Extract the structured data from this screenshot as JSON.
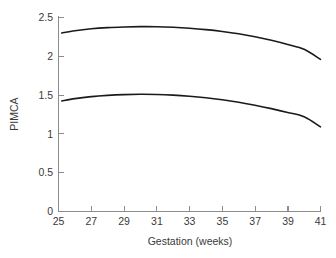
{
  "chart_data": {
    "type": "line",
    "title": "",
    "xlabel": "Gestation (weeks)",
    "ylabel": "PIMCA",
    "xlim": [
      25,
      41
    ],
    "ylim": [
      0,
      2.5
    ],
    "xticks": [
      25,
      27,
      29,
      31,
      33,
      35,
      37,
      39,
      41
    ],
    "xticklabels": [
      "25",
      "27",
      "29",
      "31",
      "33",
      "35",
      "37",
      "39",
      "41"
    ],
    "yticks": [
      0,
      0.5,
      1,
      1.5,
      2,
      2.5
    ],
    "yticklabels": [
      "0",
      "0.5",
      "1",
      "1.5",
      "2",
      "2.5"
    ],
    "grid": false,
    "legend": null,
    "line_color": "#1a1a1a",
    "axis_color": "#8c8c8c",
    "background": "#ffffff",
    "x": [
      25.2,
      26,
      27,
      28,
      29,
      30,
      31,
      32,
      33,
      34,
      35,
      36,
      37,
      38,
      39,
      40,
      41
    ],
    "series": [
      {
        "name": "upper-curve",
        "values": [
          2.3,
          2.33,
          2.355,
          2.37,
          2.378,
          2.382,
          2.381,
          2.374,
          2.362,
          2.344,
          2.32,
          2.29,
          2.252,
          2.206,
          2.152,
          2.09,
          1.96
        ]
      },
      {
        "name": "lower-curve",
        "values": [
          1.425,
          1.455,
          1.48,
          1.496,
          1.506,
          1.51,
          1.508,
          1.5,
          1.486,
          1.466,
          1.44,
          1.408,
          1.37,
          1.326,
          1.276,
          1.22,
          1.09
        ]
      }
    ]
  }
}
